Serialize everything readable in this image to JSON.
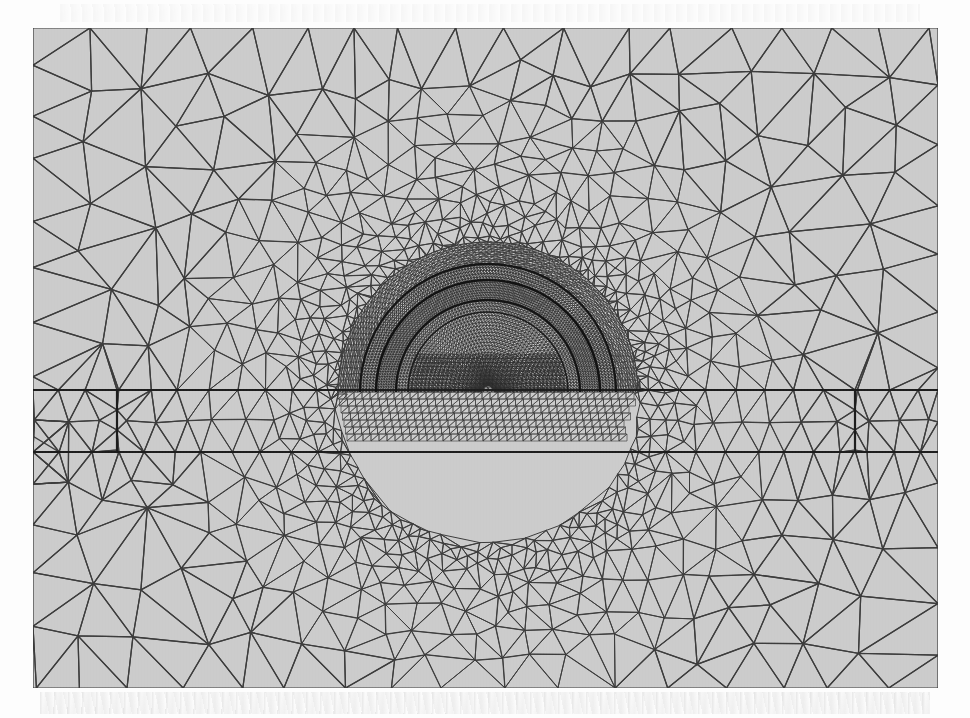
{
  "figure": {
    "kind": "finite-element-mesh",
    "caption": "",
    "background_color": "#cdcdcd",
    "line_color": "#3a3a3a",
    "paper_color": "#fdfdfd",
    "frame": {
      "x": 33,
      "y": 28,
      "width": 905,
      "height": 660
    }
  },
  "mesh_data": {
    "type": "diagram",
    "element_type": "triangle",
    "domain_extent": {
      "x_min": 0,
      "x_max": 905,
      "y_min": 0,
      "y_max": 660
    },
    "refinement_zones": [
      {
        "name": "far-field-coarse",
        "description": "coarse triangles, outer domain",
        "edge_length": 58
      },
      {
        "name": "transition-medium",
        "description": "graded transition band around tunnel",
        "edge_length": 22
      },
      {
        "name": "near-tunnel-fine",
        "description": "dense halo around tunnel opening",
        "edge_length": 8
      },
      {
        "name": "lining-ultra-fine",
        "description": "very dense mesh inside tunnel lining rings",
        "edge_length": 3
      }
    ],
    "features": [
      {
        "name": "tunnel-opening",
        "shape": "semicircle",
        "center_x": 455,
        "center_y": 364,
        "radius_outer": 128,
        "radius_lining_outer": 112,
        "radius_lining_inner": 92,
        "radius_inner_core": 80
      },
      {
        "name": "horizontal-slab-layer",
        "shape": "rectangle",
        "x_left": 84,
        "x_right": 822,
        "y_top": 362,
        "y_bottom": 424
      },
      {
        "name": "ground-surface-line",
        "shape": "line",
        "y": 362
      }
    ],
    "line_weights": {
      "interface": 2.2,
      "ordinary": 1.05,
      "fine": 0.55
    },
    "counts": {
      "approx_nodes": 11800,
      "approx_elements": 23100
    }
  },
  "labels": {
    "none_visible": ""
  }
}
